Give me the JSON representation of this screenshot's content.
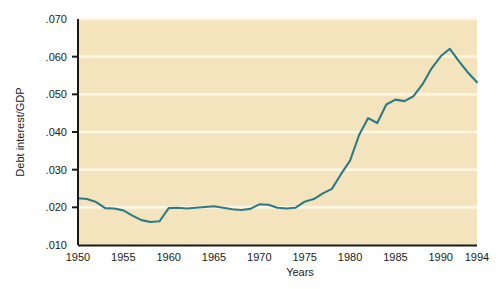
{
  "chart_data": {
    "type": "line",
    "title": "",
    "xlabel": "Years",
    "ylabel": "Debt interest/GDP",
    "xlim": [
      1950,
      1994
    ],
    "ylim": [
      0.01,
      0.07
    ],
    "grid": true,
    "legend": false,
    "legend_position": "none",
    "plot_background": "#f3e4bd",
    "line_color": "#2e7b84",
    "axis_color": "#1a1a1a",
    "gridline_color": "#fdf6e4",
    "xticks": [
      1950,
      1955,
      1960,
      1965,
      1970,
      1975,
      1980,
      1985,
      1990,
      1994
    ],
    "xtick_labels": [
      "1950",
      "1955",
      "1960",
      "1965",
      "1970",
      "1975",
      "1980",
      "1985",
      "1990",
      "1994"
    ],
    "yticks": [
      0.01,
      0.02,
      0.03,
      0.04,
      0.05,
      0.06,
      0.07
    ],
    "ytick_labels": [
      ".010",
      ".020",
      ".030",
      ".040",
      ".050",
      ".060",
      ".070"
    ],
    "series": [
      {
        "name": "Debt interest/GDP",
        "x": [
          1950,
          1951,
          1952,
          1953,
          1954,
          1955,
          1956,
          1957,
          1958,
          1959,
          1960,
          1961,
          1962,
          1963,
          1964,
          1965,
          1966,
          1967,
          1968,
          1969,
          1970,
          1971,
          1972,
          1973,
          1974,
          1975,
          1976,
          1977,
          1978,
          1979,
          1980,
          1981,
          1982,
          1983,
          1984,
          1985,
          1986,
          1987,
          1988,
          1989,
          1990,
          1991,
          1992,
          1993,
          1994
        ],
        "values": [
          0.0224,
          0.0222,
          0.0214,
          0.0198,
          0.0197,
          0.0192,
          0.0178,
          0.0166,
          0.0161,
          0.0163,
          0.0198,
          0.0199,
          0.0197,
          0.0199,
          0.0201,
          0.0203,
          0.0199,
          0.0195,
          0.0193,
          0.0196,
          0.0208,
          0.0207,
          0.0199,
          0.0197,
          0.0199,
          0.0215,
          0.0222,
          0.0237,
          0.0249,
          0.0288,
          0.0324,
          0.0392,
          0.0437,
          0.0424,
          0.0473,
          0.0486,
          0.0482,
          0.0495,
          0.0527,
          0.0569,
          0.0601,
          0.0621,
          0.0588,
          0.0558,
          0.0532
        ]
      }
    ]
  },
  "axes": {
    "y_axis_label": "Debt interest/GDP",
    "x_axis_label": "Years"
  }
}
